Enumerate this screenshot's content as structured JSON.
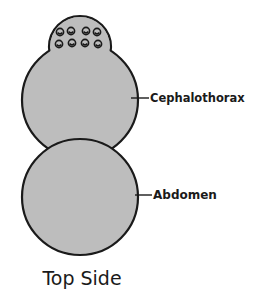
{
  "diagram": {
    "title": "Top Side",
    "labels": {
      "cephalothorax": "Cephalothorax",
      "abdomen": "Abdomen"
    },
    "parts": [
      {
        "name": "cephalothorax",
        "shape": "circle",
        "eyes": 8
      },
      {
        "name": "abdomen",
        "shape": "circle"
      }
    ],
    "colors": {
      "body_fill": "#bdbdbd",
      "outline": "#1a1a1a",
      "background": "#ffffff"
    }
  }
}
